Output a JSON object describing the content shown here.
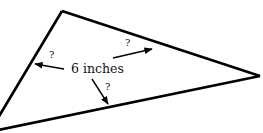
{
  "diagram": {
    "type": "triangle",
    "center_label": "6 inches",
    "unknown_marks": [
      "?",
      "?",
      "?"
    ],
    "colors": {
      "stroke": "#000000",
      "text": "#111111",
      "background": "#ffffff"
    }
  }
}
